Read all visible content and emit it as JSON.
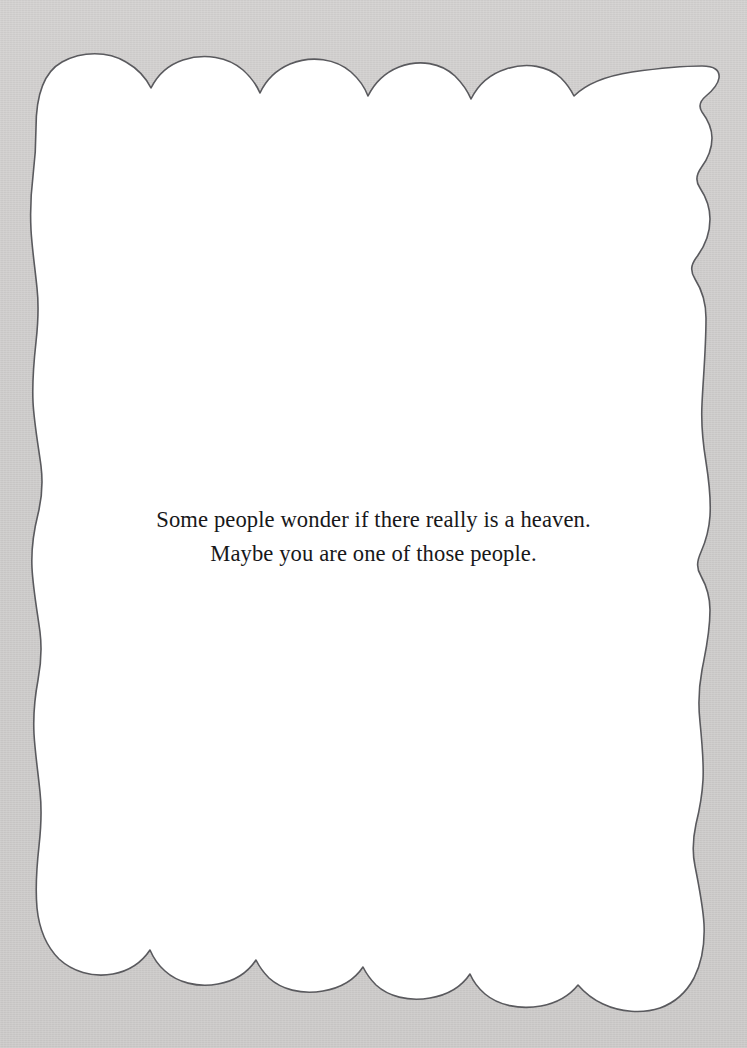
{
  "document": {
    "type": "scanned-book-page",
    "page_background_color": "#cccac9",
    "paper_color": "#ffffff",
    "paper_edge_style": "torn-scalloped",
    "paper_edge_stroke_color": "#5a5a5e",
    "text_color": "#18181a"
  },
  "content": {
    "paragraph": {
      "line_1": "Some people wonder if there really is a heaven.",
      "line_2": "Maybe you are one of those people.",
      "alignment": "center",
      "font_style": "serif"
    }
  }
}
